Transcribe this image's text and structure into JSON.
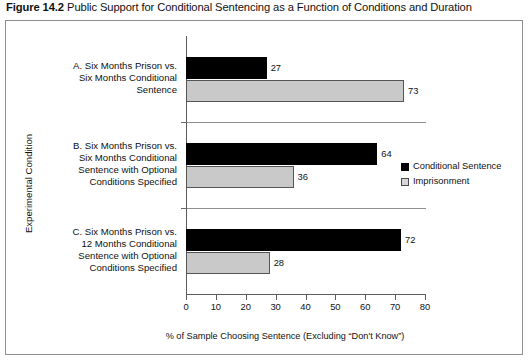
{
  "figure": {
    "number": "Figure 14.2",
    "caption": "Public Support for Conditional Sentencing as a Function of Conditions and Duration"
  },
  "chart_data": {
    "type": "bar",
    "orientation": "horizontal",
    "title": "Public Support for Conditional Sentencing as a Function of Conditions and Duration",
    "xlabel": "% of Sample Choosing Sentence (Excluding “Don't Know”)",
    "ylabel": "Experimental Condition",
    "xlim": [
      0,
      80
    ],
    "xticks": [
      "0",
      "10",
      "20",
      "30",
      "40",
      "50",
      "60",
      "70",
      "80"
    ],
    "grid": false,
    "legend_position": "right",
    "categories": [
      "A. Six Months Prison vs. Six Months Conditional Sentence",
      "B. Six Months Prison vs. Six Months Conditional Sentence with Optional Conditions Specified",
      "C. Six Months Prison vs. 12 Months Conditional Sentence with Optional Conditions Specified"
    ],
    "category_lines": [
      [
        "A. Six Months Prison vs.",
        "Six Months Conditional",
        "Sentence"
      ],
      [
        "B. Six Months Prison vs.",
        "Six Months Conditional",
        "Sentence with Optional",
        "Conditions Specified"
      ],
      [
        "C. Six Months Prison vs.",
        "12 Months Conditional",
        "Sentence with Optional",
        "Conditions Specified"
      ]
    ],
    "series": [
      {
        "name": "Conditional Sentence",
        "color": "#000000",
        "values": [
          27,
          64,
          72
        ],
        "labels": [
          "27",
          "64",
          "72"
        ]
      },
      {
        "name": "Imprisonment",
        "color": "#c9c9c9",
        "values": [
          73,
          36,
          28
        ],
        "labels": [
          "73",
          "36",
          "28"
        ]
      }
    ]
  },
  "legend": {
    "items": [
      {
        "label": "Conditional Sentence"
      },
      {
        "label": "Imprisonment"
      }
    ]
  }
}
